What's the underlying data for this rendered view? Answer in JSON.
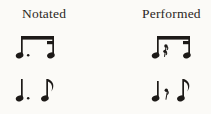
{
  "figure": {
    "background_color": "#fbfaf7",
    "ink_color": "#1d1a18",
    "columns": [
      {
        "id": "notated",
        "label": "Notated"
      },
      {
        "id": "performed",
        "label": "Performed"
      }
    ],
    "rows": [
      {
        "id": "row-1",
        "notated": {
          "description": "beamed dotted eighth note plus sixteenth note",
          "symbols": [
            "dotted-eighth-note",
            "augmentation-dot",
            "sixteenth-note",
            "beam",
            "secondary-beam-hook"
          ]
        },
        "performed": {
          "description": "beamed eighth note, sixteenth rest, sixteenth note",
          "symbols": [
            "eighth-note",
            "sixteenth-rest",
            "sixteenth-note",
            "beam",
            "secondary-beam-hook"
          ]
        }
      },
      {
        "id": "row-2",
        "notated": {
          "description": "dotted quarter note followed by eighth note",
          "symbols": [
            "dotted-quarter-note",
            "augmentation-dot",
            "eighth-note",
            "flag"
          ]
        },
        "performed": {
          "description": "quarter note, eighth rest, eighth note",
          "symbols": [
            "quarter-note",
            "eighth-rest",
            "eighth-note",
            "flag"
          ]
        }
      }
    ]
  }
}
